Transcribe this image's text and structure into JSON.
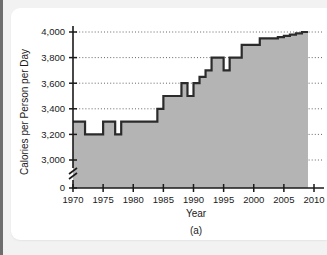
{
  "figure": {
    "caption": "(a)",
    "background_color": "#f2f2f2",
    "card_color": "#ffffff"
  },
  "chart_data": {
    "type": "area",
    "title": "",
    "xlabel": "Year",
    "ylabel": "Calories per Person per Day",
    "xlim": [
      1969,
      2011
    ],
    "ylim": [
      2900,
      4060
    ],
    "y_axis_break": true,
    "y_break_between": [
      0,
      2900
    ],
    "grid": true,
    "grid_style": "dotted-horizontal",
    "legend": "none",
    "line_color": "#2b2b2b",
    "fill_color": "#b4b4b4",
    "zero_tick_label": "0",
    "xticks": [
      1970,
      1975,
      1980,
      1985,
      1990,
      1995,
      2000,
      2005,
      2010
    ],
    "xtick_labels": [
      "1970",
      "1975",
      "1980",
      "1985",
      "1990",
      "1995",
      "2000",
      "2005",
      "2010"
    ],
    "yticks": [
      3000,
      3200,
      3400,
      3600,
      3800,
      4000
    ],
    "ytick_labels": [
      "3,000",
      "3,200",
      "3,400",
      "3,600",
      "3,800",
      "4,000"
    ],
    "x": [
      1970,
      1971,
      1972,
      1973,
      1974,
      1975,
      1976,
      1977,
      1978,
      1979,
      1980,
      1981,
      1982,
      1983,
      1984,
      1985,
      1986,
      1987,
      1988,
      1989,
      1990,
      1991,
      1992,
      1993,
      1994,
      1995,
      1996,
      1997,
      1998,
      1999,
      2000,
      2001,
      2002,
      2003,
      2004,
      2005,
      2006,
      2007,
      2008,
      2009
    ],
    "values": [
      3300,
      3300,
      3200,
      3200,
      3200,
      3300,
      3300,
      3200,
      3300,
      3300,
      3300,
      3300,
      3300,
      3300,
      3400,
      3500,
      3500,
      3500,
      3600,
      3500,
      3600,
      3650,
      3700,
      3800,
      3800,
      3700,
      3800,
      3800,
      3900,
      3900,
      3900,
      3950,
      3950,
      3950,
      3960,
      3970,
      3980,
      3990,
      4000,
      4000
    ]
  }
}
